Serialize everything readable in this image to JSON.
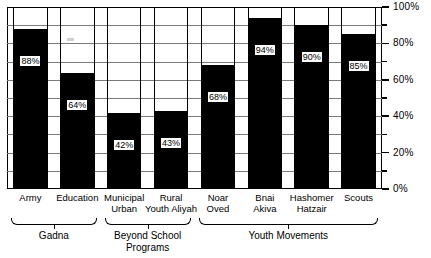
{
  "chart_data": {
    "type": "bar",
    "title": "",
    "xlabel": "",
    "ylabel": "",
    "ylim": [
      0,
      100
    ],
    "grid": true,
    "grid_interval": 10,
    "legend": "none",
    "orientation": "vertical",
    "bar_fill_color": "#000000",
    "background_color": "#ffffff",
    "categories": [
      "Army",
      "Education",
      "Municipal Urban",
      "Rural Youth Aliyah",
      "Noar Oved",
      "Bnai Akiva",
      "Hashomer Hatzair",
      "Scouts"
    ],
    "values": [
      88,
      64,
      42,
      43,
      68,
      94,
      90,
      85
    ],
    "data_labels": [
      "88%",
      "64%",
      "42%",
      "43%",
      "68%",
      "94%",
      "90%",
      "85%"
    ],
    "ytick_labels": [
      "100%",
      "80%",
      "60%",
      "40%",
      "20%",
      "0%"
    ],
    "ytick_values": [
      100,
      80,
      60,
      40,
      20,
      0
    ],
    "yminor_ticks": [
      90,
      70,
      50,
      30,
      10
    ],
    "groups": [
      {
        "label": "Gadna",
        "members": [
          "Army",
          "Education"
        ]
      },
      {
        "label": "Beyond School Programs",
        "members": [
          "Municipal Urban",
          "Rural Youth Aliyah"
        ]
      },
      {
        "label": "Youth Movements",
        "members": [
          "Noar Oved",
          "Bnai Akiva",
          "Hashomer Hatzair",
          "Scouts"
        ]
      }
    ]
  },
  "axis": {
    "y": {
      "ticks": [
        {
          "label": "100%",
          "value": 100
        },
        {
          "label": "80%",
          "value": 80
        },
        {
          "label": "60%",
          "value": 60
        },
        {
          "label": "40%",
          "value": 40
        },
        {
          "label": "20%",
          "value": 20
        },
        {
          "label": "0%",
          "value": 0
        }
      ]
    }
  },
  "categories": [
    {
      "line1": "Army",
      "line2": ""
    },
    {
      "line1": "Education",
      "line2": ""
    },
    {
      "line1": "Municipal",
      "line2": "Urban"
    },
    {
      "line1": "Rural",
      "line2": "Youth Aliyah"
    },
    {
      "line1": "Noar",
      "line2": "Oved"
    },
    {
      "line1": "Bnai",
      "line2": "Akiva"
    },
    {
      "line1": "Hashomer",
      "line2": "Hatzair"
    },
    {
      "line1": "Scouts",
      "line2": ""
    }
  ],
  "groups": [
    {
      "line1": "Gadna",
      "line2": ""
    },
    {
      "line1": "Beyond  School",
      "line2": "Programs"
    },
    {
      "line1": "Youth  Movements",
      "line2": ""
    }
  ]
}
